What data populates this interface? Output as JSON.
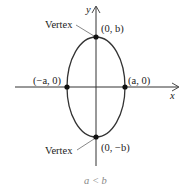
{
  "diagram": {
    "type": "ellipse-vertical-major-axis",
    "axes": {
      "x_label": "x",
      "y_label": "y"
    },
    "points": [
      {
        "id": "top-vertex",
        "label": "(0, b)"
      },
      {
        "id": "bottom-vertex",
        "label": "(0, −b)"
      },
      {
        "id": "left-intercept",
        "label": "(−a, 0)"
      },
      {
        "id": "right-intercept",
        "label": "(a, 0)"
      }
    ],
    "annotations": {
      "vertex_top": "Vertex",
      "vertex_bottom": "Vertex"
    },
    "caption": "a < b",
    "colors": {
      "curve": "#333333",
      "axis": "#333333",
      "point": "#111111",
      "caption": "#888888"
    }
  }
}
